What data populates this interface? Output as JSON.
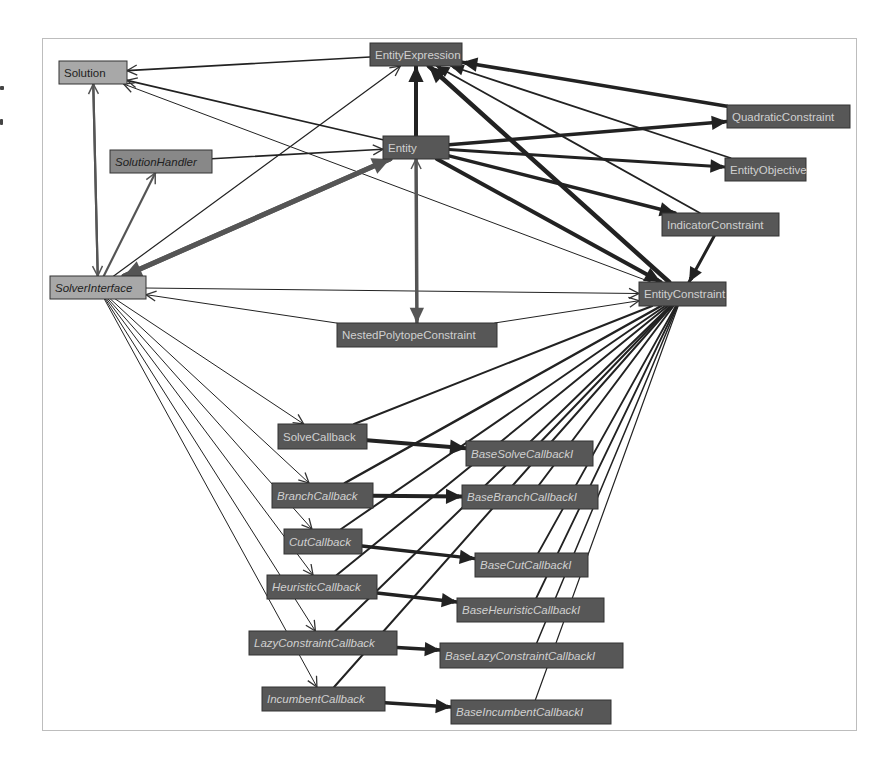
{
  "diagram": {
    "colors": {
      "background": "#ffffff",
      "frame": "#bdbdbd",
      "node_dark_fill": "#575757",
      "node_dark_stroke": "#333333",
      "node_dark_text": "#d0d0d0",
      "node_light_fill": "#a8a8a8",
      "node_light_text": "#1e1e1e",
      "node_mid_fill": "#888888",
      "node_mid_text": "#1e1e1e",
      "edge": "#222222",
      "edge_gray": "#555555"
    },
    "nodes": [
      {
        "id": "Solution",
        "label": "Solution",
        "x": 59,
        "y": 61,
        "w": 68,
        "h": 23,
        "style": "light",
        "italic": false
      },
      {
        "id": "EntityExpression",
        "label": "EntityExpression",
        "x": 370,
        "y": 43,
        "w": 92,
        "h": 23,
        "style": "dark",
        "italic": false
      },
      {
        "id": "Entity",
        "label": "Entity",
        "x": 383,
        "y": 136,
        "w": 66,
        "h": 23,
        "style": "dark",
        "italic": false
      },
      {
        "id": "SolutionHandler",
        "label": "SolutionHandler",
        "x": 110,
        "y": 150,
        "w": 102,
        "h": 23,
        "style": "mid",
        "italic": true
      },
      {
        "id": "QuadraticConstraint",
        "label": "QuadraticConstraint",
        "x": 727,
        "y": 105,
        "w": 123,
        "h": 23,
        "style": "dark",
        "italic": false
      },
      {
        "id": "EntityObjective",
        "label": "EntityObjective",
        "x": 725,
        "y": 158,
        "w": 81,
        "h": 23,
        "style": "dark",
        "italic": false
      },
      {
        "id": "IndicatorConstraint",
        "label": "IndicatorConstraint",
        "x": 662,
        "y": 213,
        "w": 117,
        "h": 23,
        "style": "dark",
        "italic": false
      },
      {
        "id": "SolverInterface",
        "label": "SolverInterface",
        "x": 50,
        "y": 276,
        "w": 96,
        "h": 23,
        "style": "light",
        "italic": true
      },
      {
        "id": "EntityConstraint",
        "label": "EntityConstraint",
        "x": 639,
        "y": 282,
        "w": 87,
        "h": 24,
        "style": "dark",
        "italic": false
      },
      {
        "id": "NestedPolytopeConstraint",
        "label": "NestedPolytopeConstraint",
        "x": 337,
        "y": 323,
        "w": 160,
        "h": 24,
        "style": "dark",
        "italic": false
      },
      {
        "id": "SolveCallback",
        "label": "SolveCallback",
        "x": 278,
        "y": 424,
        "w": 89,
        "h": 25,
        "style": "dark",
        "italic": false
      },
      {
        "id": "BaseSolveCallbackI",
        "label": "BaseSolveCallbackI",
        "x": 466,
        "y": 441,
        "w": 127,
        "h": 25,
        "style": "dark",
        "italic": true
      },
      {
        "id": "BranchCallback",
        "label": "BranchCallback",
        "x": 272,
        "y": 483,
        "w": 101,
        "h": 25,
        "style": "dark",
        "italic": true
      },
      {
        "id": "BaseBranchCallbackI",
        "label": "BaseBranchCallbackI",
        "x": 462,
        "y": 485,
        "w": 136,
        "h": 24,
        "style": "dark",
        "italic": true
      },
      {
        "id": "CutCallback",
        "label": "CutCallback",
        "x": 284,
        "y": 529,
        "w": 78,
        "h": 25,
        "style": "dark",
        "italic": true
      },
      {
        "id": "BaseCutCallbackI",
        "label": "BaseCutCallbackI",
        "x": 475,
        "y": 553,
        "w": 113,
        "h": 24,
        "style": "dark",
        "italic": true
      },
      {
        "id": "HeuristicCallback",
        "label": "HeuristicCallback",
        "x": 267,
        "y": 575,
        "w": 110,
        "h": 24,
        "style": "dark",
        "italic": true
      },
      {
        "id": "BaseHeuristicCallbackI",
        "label": "BaseHeuristicCallbackI",
        "x": 457,
        "y": 598,
        "w": 147,
        "h": 24,
        "style": "dark",
        "italic": true
      },
      {
        "id": "LazyConstraintCallback",
        "label": "LazyConstraintCallback",
        "x": 249,
        "y": 631,
        "w": 148,
        "h": 24,
        "style": "dark",
        "italic": true
      },
      {
        "id": "BaseLazyConstraintCallbackI",
        "label": "BaseLazyConstraintCallbackI",
        "x": 440,
        "y": 643,
        "w": 183,
        "h": 25,
        "style": "dark",
        "italic": true
      },
      {
        "id": "IncumbentCallback",
        "label": "IncumbentCallback",
        "x": 262,
        "y": 687,
        "w": 123,
        "h": 24,
        "style": "dark",
        "italic": true
      },
      {
        "id": "BaseIncumbentCallbackI",
        "label": "BaseIncumbentCallbackI",
        "x": 451,
        "y": 700,
        "w": 160,
        "h": 24,
        "style": "dark",
        "italic": true
      }
    ],
    "edges": [
      {
        "from": "EntityExpression",
        "to": "Solution",
        "w": 1.6,
        "head": "open"
      },
      {
        "from": "Entity",
        "to": "Solution",
        "w": 1.6,
        "head": "open"
      },
      {
        "from": "EntityConstraint",
        "to": "Solution",
        "w": 1.0,
        "head": "open"
      },
      {
        "from": "SolverInterface",
        "to": "Solution",
        "w": 2.2,
        "head": "open",
        "gray": true
      },
      {
        "from": "Solution",
        "to": "SolverInterface",
        "w": 2.2,
        "head": "open",
        "gray": true
      },
      {
        "from": "SolverInterface",
        "to": "SolutionHandler",
        "w": 2.2,
        "head": "open",
        "gray": true
      },
      {
        "from": "SolutionHandler",
        "to": "Entity",
        "w": 1.6,
        "head": "open"
      },
      {
        "from": "SolverInterface",
        "to": "EntityExpression",
        "w": 1.2,
        "head": "open"
      },
      {
        "from": "SolverInterface",
        "to": "Entity",
        "w": 5,
        "head": "filled",
        "gray": true
      },
      {
        "from": "Entity",
        "to": "SolverInterface",
        "w": 5,
        "head": "filled",
        "gray": true
      },
      {
        "from": "SolverInterface",
        "to": "EntityConstraint",
        "w": 1.0,
        "head": "open"
      },
      {
        "from": "NestedPolytopeConstraint",
        "to": "SolverInterface",
        "w": 1.0,
        "head": "open"
      },
      {
        "from": "NestedPolytopeConstraint",
        "to": "EntityConstraint",
        "w": 1.0,
        "head": "open"
      },
      {
        "from": "Entity",
        "to": "EntityExpression",
        "w": 4,
        "head": "filled"
      },
      {
        "from": "Entity",
        "to": "NestedPolytopeConstraint",
        "w": 3.5,
        "head": "filled",
        "gray": true
      },
      {
        "from": "NestedPolytopeConstraint",
        "to": "Entity",
        "w": 1.5,
        "head": "open",
        "gray": true
      },
      {
        "from": "Entity",
        "to": "QuadraticConstraint",
        "w": 3.5,
        "head": "filled"
      },
      {
        "from": "Entity",
        "to": "EntityObjective",
        "w": 3,
        "head": "filled"
      },
      {
        "from": "Entity",
        "to": "IndicatorConstraint",
        "w": 3.5,
        "head": "filled"
      },
      {
        "from": "Entity",
        "to": "EntityConstraint",
        "w": 4,
        "head": "filled"
      },
      {
        "from": "QuadraticConstraint",
        "to": "EntityExpression",
        "w": 3.5,
        "head": "filled"
      },
      {
        "from": "EntityObjective",
        "to": "EntityExpression",
        "w": 1.8,
        "head": "filled"
      },
      {
        "from": "IndicatorConstraint",
        "to": "EntityExpression",
        "w": 1.8,
        "head": "filled"
      },
      {
        "from": "EntityConstraint",
        "to": "EntityExpression",
        "w": 4.5,
        "head": "filled"
      },
      {
        "from": "IndicatorConstraint",
        "to": "EntityConstraint",
        "w": 3,
        "head": "filled"
      },
      {
        "from": "SolverInterface",
        "to": "SolveCallback",
        "w": 1.0,
        "head": "open"
      },
      {
        "from": "SolverInterface",
        "to": "BranchCallback",
        "w": 1.0,
        "head": "open"
      },
      {
        "from": "SolverInterface",
        "to": "CutCallback",
        "w": 1.0,
        "head": "open"
      },
      {
        "from": "SolverInterface",
        "to": "HeuristicCallback",
        "w": 1.0,
        "head": "open"
      },
      {
        "from": "SolverInterface",
        "to": "LazyConstraintCallback",
        "w": 1.0,
        "head": "open"
      },
      {
        "from": "SolverInterface",
        "to": "IncumbentCallback",
        "w": 1.0,
        "head": "open"
      },
      {
        "from": "SolveCallback",
        "to": "BaseSolveCallbackI",
        "w": 4,
        "head": "filled"
      },
      {
        "from": "BranchCallback",
        "to": "BaseBranchCallbackI",
        "w": 4,
        "head": "filled"
      },
      {
        "from": "CutCallback",
        "to": "BaseCutCallbackI",
        "w": 3.5,
        "head": "filled"
      },
      {
        "from": "HeuristicCallback",
        "to": "BaseHeuristicCallbackI",
        "w": 3.5,
        "head": "filled"
      },
      {
        "from": "LazyConstraintCallback",
        "to": "BaseLazyConstraintCallbackI",
        "w": 3.5,
        "head": "filled"
      },
      {
        "from": "IncumbentCallback",
        "to": "BaseIncumbentCallbackI",
        "w": 3.5,
        "head": "filled"
      },
      {
        "from": "SolveCallback",
        "to": "EntityConstraint",
        "w": 2,
        "head": "none"
      },
      {
        "from": "BranchCallback",
        "to": "EntityConstraint",
        "w": 2.5,
        "head": "none"
      },
      {
        "from": "CutCallback",
        "to": "EntityConstraint",
        "w": 2,
        "head": "none"
      },
      {
        "from": "HeuristicCallback",
        "to": "EntityConstraint",
        "w": 2,
        "head": "none"
      },
      {
        "from": "LazyConstraintCallback",
        "to": "EntityConstraint",
        "w": 2,
        "head": "none"
      },
      {
        "from": "IncumbentCallback",
        "to": "EntityConstraint",
        "w": 2,
        "head": "none"
      },
      {
        "from": "BaseSolveCallbackI",
        "to": "EntityConstraint",
        "w": 2,
        "head": "none"
      },
      {
        "from": "BaseBranchCallbackI",
        "to": "EntityConstraint",
        "w": 2,
        "head": "none"
      },
      {
        "from": "BaseCutCallbackI",
        "to": "EntityConstraint",
        "w": 1.8,
        "head": "none"
      },
      {
        "from": "BaseHeuristicCallbackI",
        "to": "EntityConstraint",
        "w": 1.8,
        "head": "none"
      },
      {
        "from": "BaseLazyConstraintCallbackI",
        "to": "EntityConstraint",
        "w": 1.5,
        "head": "none"
      },
      {
        "from": "BaseIncumbentCallbackI",
        "to": "EntityConstraint",
        "w": 1.2,
        "head": "none"
      }
    ]
  }
}
